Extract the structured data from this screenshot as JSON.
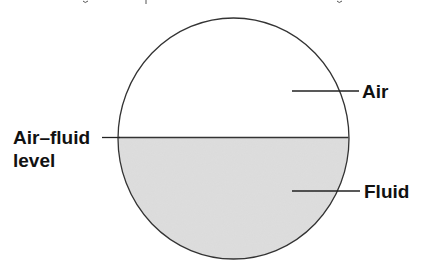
{
  "diagram": {
    "title": "",
    "colors": {
      "background": "#ffffff",
      "outline": "#333333",
      "fluid_fill": "#dedede",
      "leader_line": "#222222",
      "label_text": "#111111"
    },
    "vessel": {
      "shape": "circle",
      "cx": 233.5,
      "cy": 138.5,
      "rx": 115.5,
      "ry": 120.5,
      "fluid_level_y": 137.5
    },
    "labels": {
      "air": "Air",
      "fluid": "Fluid",
      "air_fluid_level_line1": "Air–fluid",
      "air_fluid_level_line2": "level"
    },
    "leaders": {
      "air": {
        "x1": 292,
        "y1": 91,
        "x2": 359,
        "y2": 91
      },
      "fluid": {
        "x1": 292,
        "y1": 191,
        "x2": 360,
        "y2": 191
      },
      "air_fluid_level": {
        "x1": 102,
        "y1": 137.5,
        "x2": 120,
        "y2": 137.5
      }
    }
  }
}
